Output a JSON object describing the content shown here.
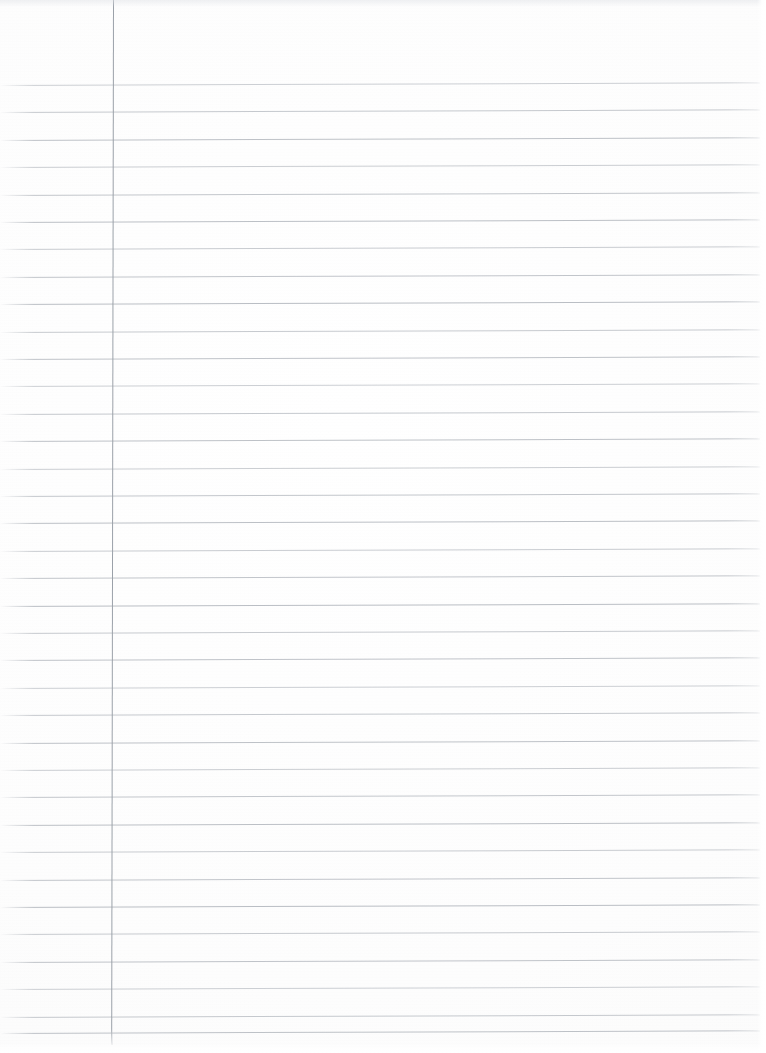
{
  "document": {
    "kind": "lined-notebook-paper",
    "description": "Blank scanned sheet of ruled notebook paper with a single vertical left margin line",
    "page_width": 766,
    "page_height": 1053,
    "has_text": false,
    "text_content": "",
    "background_color": "#fdfdfd",
    "paper_tone": "#fafafa"
  },
  "ruling": {
    "style": "college-ruled-horizontal",
    "line_color": "#b9bdc3",
    "line_thickness_px": 1,
    "line_spacing_px": 27.4,
    "first_line_y": 85,
    "last_line_y": 1033,
    "line_count": 35,
    "line_start_x": 0,
    "line_end_x": 760,
    "skew_degrees": -0.2,
    "top_margin_px": 85,
    "line_y_positions": [
      85,
      112.4,
      139.8,
      167.2,
      194.6,
      222,
      249.4,
      276.8,
      304.2,
      331.6,
      359,
      386.4,
      413.8,
      441.2,
      468.6,
      496,
      523.4,
      550.8,
      578.2,
      605.6,
      633,
      660.4,
      687.8,
      715.2,
      742.6,
      770,
      797.4,
      824.8,
      852.2,
      879.6,
      907,
      934.4,
      961.8,
      989.2,
      1016.6,
      1033
    ]
  },
  "margin_rule": {
    "orientation": "vertical",
    "color": "#9ba1a9",
    "thickness_px": 1,
    "x": 113,
    "y_start": 0,
    "y_end": 1045
  },
  "edges": {
    "right_edge_highlight_width": 9,
    "bottom_edge_highlight_height": 10,
    "top_edge_shadow_height": 7
  }
}
